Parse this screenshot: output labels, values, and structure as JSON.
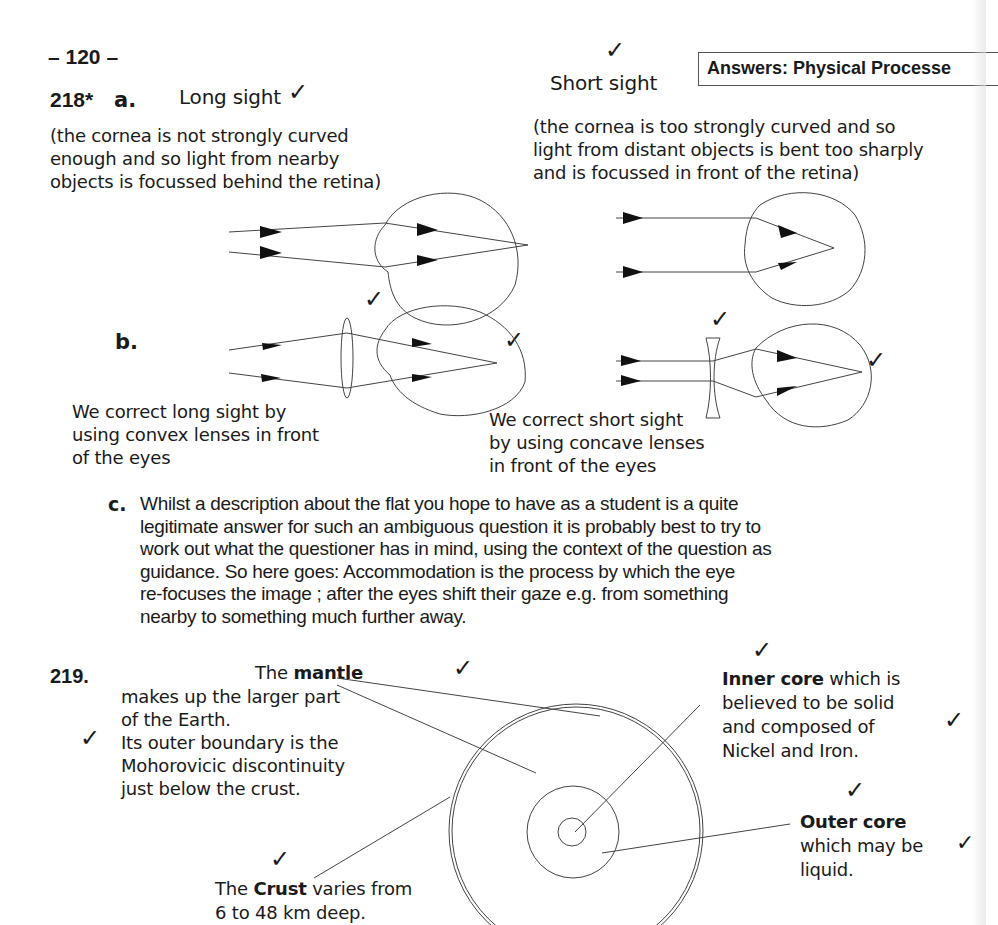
{
  "page": {
    "page_number": "– 120 –",
    "section_header": "Answers:  Physical Processe"
  },
  "q218": {
    "number": "218*",
    "part_a": {
      "label": "a.",
      "long_sight": {
        "title": "Long sight",
        "explanation": [
          "(the cornea is not strongly curved",
          "enough and so light from nearby",
          "objects is focussed behind the retina)"
        ]
      },
      "short_sight": {
        "title": "Short sight",
        "explanation": [
          "(the cornea is too strongly curved and so",
          "light from distant objects is bent too sharply",
          "and is focussed in front of the retina)"
        ]
      }
    },
    "part_b": {
      "label": "b.",
      "long_sight_correction": [
        "We correct long sight by",
        "using convex lenses in front",
        "of the eyes"
      ],
      "short_sight_correction": [
        "We correct short sight",
        "by using concave lenses",
        "in front of the eyes"
      ]
    },
    "part_c": {
      "label": "c.",
      "lines": [
        "Whilst a description about the flat you hope to have as a student is a quite",
        "legitimate answer for such an ambiguous question it is probably best to try to",
        "work out what the questioner has in mind, using the context of the question as",
        "guidance. So here goes:    Accommodation is the process by which the eye",
        "re-focuses the image ;      after the eyes shift their gaze e.g. from something",
        "nearby to something much further away."
      ]
    }
  },
  "q219": {
    "number": "219.",
    "mantle": {
      "prefix": "The ",
      "term": "mantle",
      "lines": [
        "makes up the larger part",
        "of the Earth.",
        "Its outer boundary is the",
        "Mohorovicic discontinuity",
        "just below the crust."
      ]
    },
    "crust": {
      "prefix": "The ",
      "term": "Crust",
      "suffix": " varies from",
      "line2": "6 to 48 km deep."
    },
    "inner_core": {
      "term": "Inner core",
      "suffix": " which is",
      "lines": [
        "believed to be solid",
        "and composed of",
        "Nickel and Iron."
      ]
    },
    "outer_core": {
      "term": "Outer core",
      "lines": [
        "which may be",
        "liquid."
      ]
    }
  },
  "marks": {
    "tick_glyph": "✓",
    "tick_color": "#222222"
  }
}
